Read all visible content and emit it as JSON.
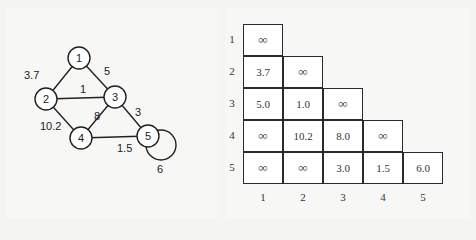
{
  "graph": {
    "nodes": [
      {
        "id": "1",
        "label": "1",
        "x": 79,
        "y": 58
      },
      {
        "id": "2",
        "label": "2",
        "x": 46,
        "y": 99
      },
      {
        "id": "3",
        "label": "3",
        "x": 115,
        "y": 97
      },
      {
        "id": "4",
        "label": "4",
        "x": 81,
        "y": 138
      },
      {
        "id": "5",
        "label": "5",
        "x": 148,
        "y": 136
      }
    ],
    "edges": [
      {
        "from": "1",
        "to": "2",
        "weight": "3.7",
        "lx": 24,
        "ly": 79
      },
      {
        "from": "1",
        "to": "3",
        "weight": "5",
        "lx": 104,
        "ly": 75
      },
      {
        "from": "2",
        "to": "3",
        "weight": "1",
        "lx": 80,
        "ly": 93
      },
      {
        "from": "2",
        "to": "4",
        "weight": "10.2",
        "lx": 40,
        "ly": 130
      },
      {
        "from": "3",
        "to": "4",
        "weight": "8",
        "lx": 94,
        "ly": 120
      },
      {
        "from": "3",
        "to": "5",
        "weight": "3",
        "lx": 135,
        "ly": 116
      },
      {
        "from": "4",
        "to": "5",
        "weight": "1.5",
        "lx": 117,
        "ly": 152
      },
      {
        "from": "5",
        "to": "5",
        "weight": "6",
        "lx": 157,
        "ly": 173
      }
    ]
  },
  "matrix": {
    "row_labels": [
      "1",
      "2",
      "3",
      "4",
      "5"
    ],
    "col_labels": [
      "1",
      "2",
      "3",
      "4",
      "5"
    ],
    "rows": [
      [
        "∞"
      ],
      [
        "3.7",
        "∞"
      ],
      [
        "5.0",
        "1.0",
        "∞"
      ],
      [
        "∞",
        "10.2",
        "8.0",
        "∞"
      ],
      [
        "∞",
        "∞",
        "3.0",
        "1.5",
        "6.0"
      ]
    ]
  }
}
